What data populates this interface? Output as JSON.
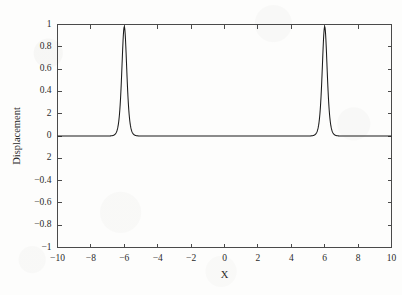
{
  "chart_data": {
    "type": "line",
    "title": "",
    "subtitle": "",
    "xlabel": "X",
    "ylabel": "Displacement",
    "xlim": [
      -10,
      10
    ],
    "ylim": [
      -1,
      1
    ],
    "grid": false,
    "legend": null,
    "legend_position": "none",
    "frame": "box",
    "tick_direction": "in",
    "line_color": "#1b1b1b",
    "axis_color": "#4a4a4a",
    "background_color": "#fdfdfc",
    "xticks": [
      -10,
      -8,
      -6,
      -4,
      -2,
      0,
      2,
      4,
      6,
      8,
      10
    ],
    "xtick_labels": [
      "-10",
      "-8",
      "-6",
      "-4",
      "-2",
      "0",
      "2",
      "4",
      "6",
      "8",
      "10"
    ],
    "yticks": [
      1,
      0.8,
      0.6,
      0.4,
      0.2,
      0,
      -0.2,
      -0.4,
      -0.6,
      -0.8,
      -1
    ],
    "ytick_labels": [
      "1",
      "0.8",
      "0.6",
      "0.4",
      "2",
      "0",
      "2",
      "-0.4",
      "-0.6",
      "-0.8",
      "-1"
    ],
    "annotations": [],
    "series": [
      {
        "name": "Displacement",
        "description": "Two identical sharp soliton (sech-squared) pulses on a flat zero baseline, centred at x = -6 and x = +6, each reaching a peak amplitude of about 0.98.",
        "peak_amplitude": 0.98,
        "peak_centers": [
          -6,
          6
        ],
        "peak_halfwidth": 0.2,
        "baseline": 0,
        "x": [
          -10,
          -9.5,
          -9,
          -8.5,
          -8,
          -7.5,
          -7,
          -6.8,
          -6.6,
          -6.5,
          -6.4,
          -6.3,
          -6.2,
          -6.1,
          -6.05,
          -6,
          -5.95,
          -5.9,
          -5.8,
          -5.7,
          -5.6,
          -5.5,
          -5.4,
          -5.2,
          -5,
          -4.5,
          -4,
          -3.5,
          -3,
          -2.5,
          -2,
          -1.5,
          -1,
          -0.5,
          0,
          0.5,
          1,
          1.5,
          2,
          2.5,
          3,
          3.5,
          4,
          4.5,
          5,
          5.2,
          5.4,
          5.5,
          5.6,
          5.7,
          5.8,
          5.9,
          5.95,
          6,
          6.05,
          6.1,
          6.2,
          6.3,
          6.4,
          6.5,
          6.6,
          6.8,
          7,
          7.5,
          8,
          8.5,
          9,
          9.5,
          10
        ],
        "y": [
          0,
          0,
          0,
          0,
          0,
          0.0001,
          0.0015,
          0.0035,
          0.0082,
          0.0126,
          0.0194,
          0.0297,
          0.0453,
          0.0687,
          0.0844,
          0.98,
          0.0844,
          0.0687,
          0.0453,
          0.0297,
          0.0194,
          0.0126,
          0.0082,
          0.0035,
          0.0015,
          0.0001,
          0,
          0,
          0,
          0,
          0,
          0,
          0,
          0,
          0,
          0,
          0,
          0,
          0,
          0,
          0,
          0,
          0,
          0.0001,
          0.0015,
          0.0035,
          0.0082,
          0.0126,
          0.0194,
          0.0297,
          0.0453,
          0.0687,
          0.0844,
          0.98,
          0.0844,
          0.0687,
          0.0453,
          0.0297,
          0.0194,
          0.0126,
          0.0082,
          0.0035,
          0.0015,
          0.0001,
          0,
          0,
          0,
          0,
          0
        ]
      }
    ]
  }
}
